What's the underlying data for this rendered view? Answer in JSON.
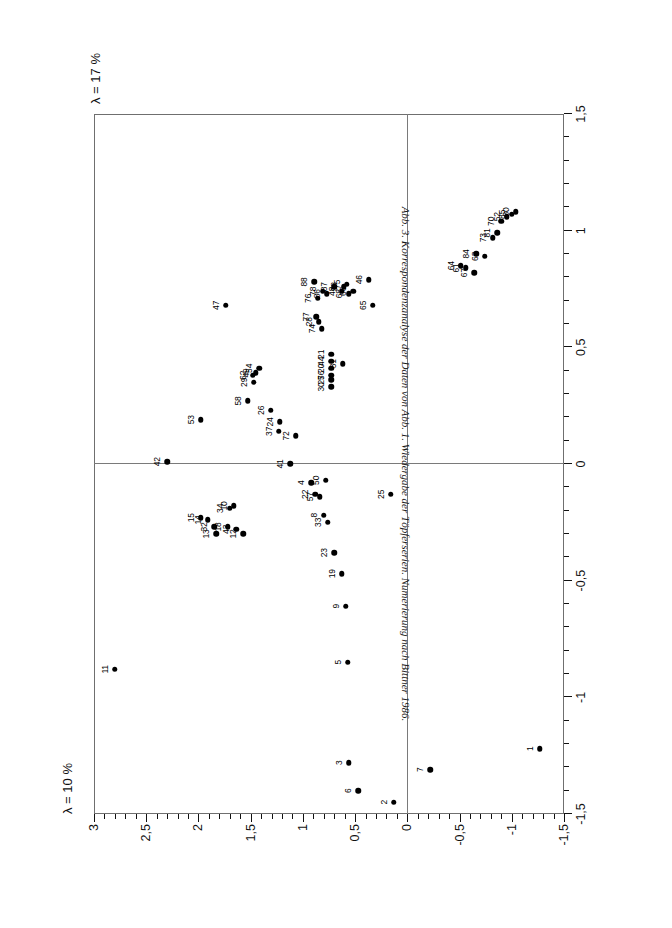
{
  "figure": {
    "caption": "Abb. 3. Korrespondenzanalyse der Daten von Abb. 1. Wiedergabe der Töpferserien. Numerierung nach Bittner 1986.",
    "lambda_x_label": "λ = 17 %",
    "lambda_y_label": "λ = 10 %",
    "orientation": "rotated-90-landscape-plate",
    "point_color": "#000000",
    "frame_color": "#6f6f6f"
  },
  "chart_data": {
    "type": "scatter",
    "title": "Abb. 3. Korrespondenzanalyse der Daten von Abb. 1. Wiedergabe der Töpferserien. Numerierung nach Bittner 1986.",
    "xlabel": "λ = 17 %",
    "ylabel": "λ = 10 %",
    "xlim": [
      -1.5,
      1.5
    ],
    "ylim": [
      -1.5,
      3.0
    ],
    "grid": false,
    "legend": null,
    "x_ticks": [
      -1.5,
      -1.25,
      -1.0,
      -0.75,
      -0.5,
      -0.25,
      0,
      0.25,
      0.5,
      0.75,
      1.0,
      1.25,
      1.5
    ],
    "x_tick_labels": [
      "-1,5",
      "",
      "-1",
      "",
      "-0,5",
      "",
      "0",
      "",
      "0,5",
      "",
      "1",
      "",
      "1,5"
    ],
    "y_ticks": [
      -1.5,
      -1.25,
      -1.0,
      -0.75,
      -0.5,
      -0.25,
      0,
      0.25,
      0.5,
      0.75,
      1.0,
      1.25,
      1.5,
      1.75,
      2.0,
      2.25,
      2.5,
      2.75,
      3.0
    ],
    "y_tick_labels": [
      "-1,5",
      "",
      "-1",
      "",
      "-0,5",
      "",
      "0",
      "",
      "0,5",
      "",
      "1",
      "",
      "1,5",
      "",
      "2",
      "",
      "2,5",
      "",
      "3"
    ],
    "minor_tick_step": 0.1,
    "series": [
      {
        "name": "Töpferserien",
        "marker": "filled-circle",
        "labels": [
          "1",
          "2",
          "3",
          "4",
          "5",
          "6",
          "7",
          "8",
          "9",
          "10",
          "11",
          "12",
          "13",
          "14",
          "15",
          "18",
          "19",
          "20",
          "21",
          "22",
          "23",
          "24",
          "25",
          "26",
          "27",
          "28",
          "29",
          "30",
          "31",
          "32",
          "33",
          "34",
          "37",
          "38",
          "41",
          "42",
          "43",
          "44",
          "46",
          "47",
          "48",
          "49",
          "50",
          "52",
          "53",
          "54",
          "56",
          "57",
          "58",
          "61",
          "62",
          "63",
          "64",
          "65",
          "66",
          "67",
          "68",
          "70",
          "72",
          "73",
          "74",
          "75",
          "76",
          "77",
          "78",
          "80",
          "81",
          "84",
          "85",
          "86",
          "87",
          "88"
        ],
        "points": [
          {
            "label": "1",
            "x": -1.22,
            "y": -1.27
          },
          {
            "label": "2",
            "x": -1.45,
            "y": 0.13
          },
          {
            "label": "3",
            "x": -1.28,
            "y": 0.56
          },
          {
            "label": "4",
            "x": -0.08,
            "y": 0.92
          },
          {
            "label": "5",
            "x": -0.85,
            "y": 0.57
          },
          {
            "label": "6",
            "x": -1.4,
            "y": 0.47
          },
          {
            "label": "7",
            "x": -1.31,
            "y": -0.22
          },
          {
            "label": "8",
            "x": -0.22,
            "y": 0.8
          },
          {
            "label": "9",
            "x": -0.61,
            "y": 0.59
          },
          {
            "label": "10",
            "x": -0.18,
            "y": 1.66
          },
          {
            "label": "11",
            "x": -0.88,
            "y": 2.8
          },
          {
            "label": "12",
            "x": -0.3,
            "y": 1.57
          },
          {
            "label": "13",
            "x": -0.3,
            "y": 1.83
          },
          {
            "label": "14",
            "x": -0.24,
            "y": 1.91
          },
          {
            "label": "15",
            "x": -0.23,
            "y": 1.98
          },
          {
            "label": "18",
            "x": -0.27,
            "y": 1.72
          },
          {
            "label": "19",
            "x": -0.47,
            "y": 0.63
          },
          {
            "label": "20",
            "x": 0.41,
            "y": 0.73
          },
          {
            "label": "21",
            "x": 0.47,
            "y": 0.73
          },
          {
            "label": "22",
            "x": -0.13,
            "y": 0.88
          },
          {
            "label": "23",
            "x": -0.38,
            "y": 0.7
          },
          {
            "label": "24",
            "x": 0.18,
            "y": 1.22
          },
          {
            "label": "25",
            "x": -0.13,
            "y": 0.16
          },
          {
            "label": "26",
            "x": 0.23,
            "y": 1.31
          },
          {
            "label": "27",
            "x": 0.36,
            "y": 0.73
          },
          {
            "label": "28",
            "x": 0.61,
            "y": 0.85
          },
          {
            "label": "29",
            "x": 0.35,
            "y": 1.47
          },
          {
            "label": "30",
            "x": 0.33,
            "y": 0.73
          },
          {
            "label": "31",
            "x": 0.43,
            "y": 0.62
          },
          {
            "label": "32",
            "x": -0.27,
            "y": 1.85
          },
          {
            "label": "33",
            "x": -0.25,
            "y": 0.76
          },
          {
            "label": "34",
            "x": -0.19,
            "y": 1.7
          },
          {
            "label": "37",
            "x": 0.14,
            "y": 1.23
          },
          {
            "label": "38",
            "x": 0.76,
            "y": 0.61
          },
          {
            "label": "41",
            "x": 0.0,
            "y": 1.12
          },
          {
            "label": "42",
            "x": 0.01,
            "y": 2.3
          },
          {
            "label": "43",
            "x": -0.28,
            "y": 1.64
          },
          {
            "label": "44",
            "x": 0.44,
            "y": 0.73
          },
          {
            "label": "46",
            "x": 0.79,
            "y": 0.37
          },
          {
            "label": "47",
            "x": 0.68,
            "y": 1.74
          },
          {
            "label": "48",
            "x": 0.74,
            "y": 0.63
          },
          {
            "label": "49",
            "x": 0.39,
            "y": 1.45
          },
          {
            "label": "50",
            "x": -0.07,
            "y": 0.78
          },
          {
            "label": "52",
            "x": 1.06,
            "y": -0.95
          },
          {
            "label": "53",
            "x": 0.19,
            "y": 1.98
          },
          {
            "label": "54",
            "x": 0.41,
            "y": 1.42
          },
          {
            "label": "56",
            "x": 0.38,
            "y": 0.73
          },
          {
            "label": "57",
            "x": -0.14,
            "y": 0.84
          },
          {
            "label": "58",
            "x": 0.27,
            "y": 1.53
          },
          {
            "label": "61",
            "x": 0.84,
            "y": -0.56
          },
          {
            "label": "62",
            "x": 0.38,
            "y": 1.48
          },
          {
            "label": "63",
            "x": 0.89,
            "y": -0.74
          },
          {
            "label": "64",
            "x": 0.85,
            "y": -0.51
          },
          {
            "label": "65",
            "x": 0.68,
            "y": 0.33
          },
          {
            "label": "66",
            "x": 0.74,
            "y": 0.52
          },
          {
            "label": "67",
            "x": 0.82,
            "y": -0.64
          },
          {
            "label": "68",
            "x": 0.73,
            "y": 0.56
          },
          {
            "label": "70",
            "x": 1.04,
            "y": -0.9
          },
          {
            "label": "72",
            "x": 0.12,
            "y": 1.07
          },
          {
            "label": "73",
            "x": 0.97,
            "y": -0.82
          },
          {
            "label": "74",
            "x": 0.58,
            "y": 0.82
          },
          {
            "label": "75",
            "x": 0.77,
            "y": 0.58
          },
          {
            "label": "76",
            "x": 0.71,
            "y": 0.86
          },
          {
            "label": "77",
            "x": 0.63,
            "y": 0.87
          },
          {
            "label": "78",
            "x": 0.74,
            "y": 0.81
          },
          {
            "label": "80",
            "x": 1.08,
            "y": -1.04
          },
          {
            "label": "81",
            "x": 0.99,
            "y": -0.86
          },
          {
            "label": "84",
            "x": 0.9,
            "y": -0.66
          },
          {
            "label": "85",
            "x": 1.07,
            "y": -1.0
          },
          {
            "label": "86",
            "x": 0.73,
            "y": 0.77
          },
          {
            "label": "87",
            "x": 0.76,
            "y": 0.7
          },
          {
            "label": "88",
            "x": 0.78,
            "y": 0.89
          }
        ]
      }
    ]
  }
}
